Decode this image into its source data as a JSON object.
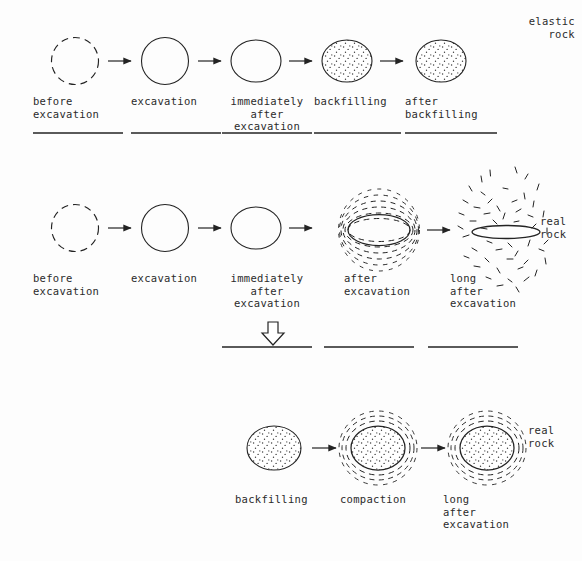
{
  "diagram": {
    "title_implicit": "Tunnel excavation and backfilling sequence in elastic rock versus real rock",
    "rows": [
      {
        "id": "row-elastic-rock",
        "rock_label": "elastic\nrock",
        "rock_label_lines": [
          "elastic",
          "rock"
        ],
        "stages": [
          {
            "id": "s1",
            "label_lines": [
              "before",
              "excavation"
            ],
            "align": "left",
            "shape": "dashed-circle",
            "underline": true
          },
          {
            "id": "s2",
            "label_lines": [
              "excavation"
            ],
            "align": "left",
            "shape": "solid-circle",
            "underline": true
          },
          {
            "id": "s3",
            "label_lines": [
              "immediately",
              "after",
              "excavation"
            ],
            "align": "center",
            "shape": "solid-ellipse",
            "underline": true
          },
          {
            "id": "s4",
            "label_lines": [
              "backfilling"
            ],
            "align": "left",
            "shape": "stippled-ellipse",
            "underline": true
          },
          {
            "id": "s5",
            "label_lines": [
              "after",
              "backfilling"
            ],
            "align": "left",
            "shape": "stippled-ellipse",
            "underline": true
          }
        ]
      },
      {
        "id": "row-real-rock",
        "rock_label": "real\nrock",
        "rock_label_lines": [
          "real",
          "rock"
        ],
        "stages": [
          {
            "id": "s1",
            "label_lines": [
              "before",
              "excavation"
            ],
            "align": "left",
            "shape": "dashed-circle",
            "underline": false
          },
          {
            "id": "s2",
            "label_lines": [
              "excavation"
            ],
            "align": "left",
            "shape": "solid-circle",
            "underline": false
          },
          {
            "id": "s3",
            "label_lines": [
              "immediately",
              "after",
              "excavation"
            ],
            "align": "center",
            "shape": "solid-ellipse",
            "underline": true
          },
          {
            "id": "s4",
            "label_lines": [
              "after",
              "excavation"
            ],
            "align": "left",
            "shape": "flat-ellipse-dashed-rings",
            "underline": true
          },
          {
            "id": "s5",
            "label_lines": [
              "long",
              "after",
              "excavation"
            ],
            "align": "left",
            "shape": "collapsed-ellipse-fractured",
            "underline": true
          }
        ]
      },
      {
        "id": "row-real-rock-backfilled",
        "rock_label": "real\nrock",
        "rock_label_lines": [
          "real",
          "rock"
        ],
        "stages": [
          {
            "id": "s1",
            "label_lines": [
              "backfilling"
            ],
            "align": "left",
            "shape": "stippled-ellipse",
            "underline": false
          },
          {
            "id": "s2",
            "label_lines": [
              "compaction"
            ],
            "align": "left",
            "shape": "stippled-ellipse-dashed-rings",
            "underline": false
          },
          {
            "id": "s3",
            "label_lines": [
              "long",
              "after",
              "excavation"
            ],
            "align": "left",
            "shape": "stippled-ellipse-dashed-rings",
            "underline": false
          }
        ]
      }
    ],
    "transition_arrow": {
      "glyph": "hollow-down-arrow",
      "description": "large hollow downward arrow linking the real-rock row to the backfilled real-rock row"
    },
    "arrow_glyph": "right-arrow",
    "colors": {
      "ink": "#232323",
      "background": "#fdfdfd",
      "stipple": "#3a3a3a"
    }
  }
}
